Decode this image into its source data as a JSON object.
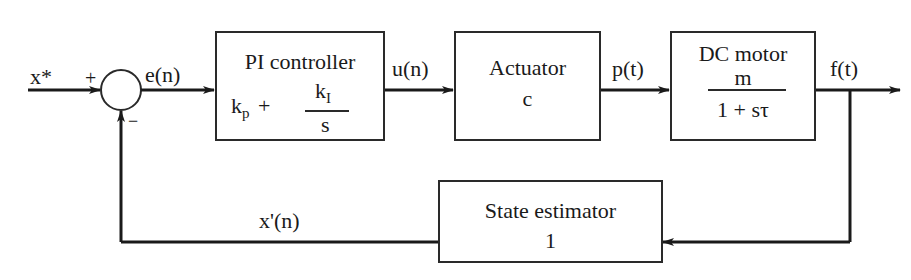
{
  "diagram": {
    "type": "feedback control block diagram",
    "signals": {
      "input": "x*",
      "error": "e(n)",
      "control": "u(n)",
      "actuator_out": "p(t)",
      "output": "f(t)",
      "feedback": "x'(n)"
    },
    "summing_junction": {
      "plus_sign": "+",
      "minus_sign": "−"
    },
    "blocks": {
      "pi": {
        "title": "PI controller",
        "kp": "k",
        "kp_sub": "p",
        "plus": "+",
        "ki": "k",
        "ki_sub": "I",
        "den": "s"
      },
      "actuator": {
        "title": "Actuator",
        "value": "c"
      },
      "motor": {
        "title": "DC motor",
        "num": "m",
        "den": "1 + sτ"
      },
      "estimator": {
        "title": "State estimator",
        "value": "1"
      }
    },
    "colors": {
      "line": "#1a1a1a",
      "background": "#ffffff"
    }
  }
}
